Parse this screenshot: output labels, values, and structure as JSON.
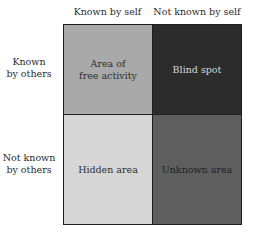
{
  "columns": [
    {
      "label": "Known by self"
    },
    {
      "label": "Not known by self"
    }
  ],
  "rows": [
    {
      "label_line1": "Known",
      "label_line2": "by others"
    },
    {
      "label_line1": "Not known",
      "label_line2": "by others"
    }
  ],
  "cells": {
    "known_known": {
      "line1": "Area of",
      "line2": "free activity",
      "color": "#a9a9a9"
    },
    "blind_spot": {
      "line1": "Blind spot",
      "color": "#2c2c2c"
    },
    "hidden_area": {
      "line1": "Hidden area",
      "color": "#d6d6d6"
    },
    "unknown_area": {
      "line1": "Unknown area",
      "color": "#5e5e5e"
    }
  }
}
